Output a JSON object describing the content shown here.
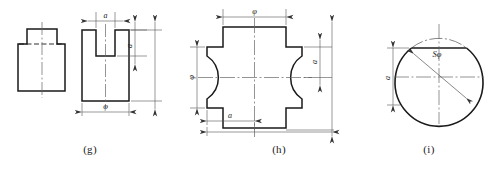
{
  "figure_sheet": {
    "background_color": "#ffffff",
    "line_color": "#1a1a1a",
    "dimension_line_color": "#555555",
    "centerline_color": "#666666"
  },
  "figures": [
    {
      "id": "g",
      "caption": "(g)",
      "description": "Two orthographic views of a slotted block: a stepped front view and a U-channel view",
      "dimensions": [
        {
          "name": "slot-width",
          "label": "a",
          "position": "top",
          "orientation": "horizontal"
        },
        {
          "name": "slot-depth",
          "label": "a",
          "position": "right-upper",
          "orientation": "vertical"
        },
        {
          "name": "overall-width",
          "label": "φ",
          "position": "bottom",
          "orientation": "horizontal"
        },
        {
          "name": "overall-height",
          "label": "",
          "position": "right-outer",
          "orientation": "vertical"
        }
      ]
    },
    {
      "id": "h",
      "caption": "(h)",
      "description": "Cross shaped plate with two inward bulging arcs on left and right",
      "dimensions": [
        {
          "name": "top-width",
          "label": "φ",
          "position": "top",
          "orientation": "horizontal"
        },
        {
          "name": "left-height",
          "label": "φ",
          "position": "left",
          "orientation": "vertical"
        },
        {
          "name": "right-arm-height",
          "label": "a",
          "position": "right-inner",
          "orientation": "vertical"
        },
        {
          "name": "bottom-arm-width",
          "label": "a",
          "position": "bottom-inner",
          "orientation": "horizontal"
        },
        {
          "name": "overall-width",
          "label": "",
          "position": "bottom-outer",
          "orientation": "horizontal"
        },
        {
          "name": "overall-height",
          "label": "",
          "position": "right-outer",
          "orientation": "vertical"
        }
      ]
    },
    {
      "id": "i",
      "caption": "(i)",
      "description": "Sphere shown as a circle with a flat chord cut near the top",
      "dimensions": [
        {
          "name": "sphere-diameter",
          "label": "Sφ",
          "position": "diagonal",
          "orientation": "diagonal"
        },
        {
          "name": "flat-offset-height",
          "label": "a",
          "position": "left",
          "orientation": "vertical"
        }
      ]
    }
  ],
  "captions": {
    "g": "(g)",
    "h": "(h)",
    "i": "(i)"
  },
  "labels": {
    "a": "a",
    "phi": "φ",
    "s_phi": "Sφ"
  }
}
